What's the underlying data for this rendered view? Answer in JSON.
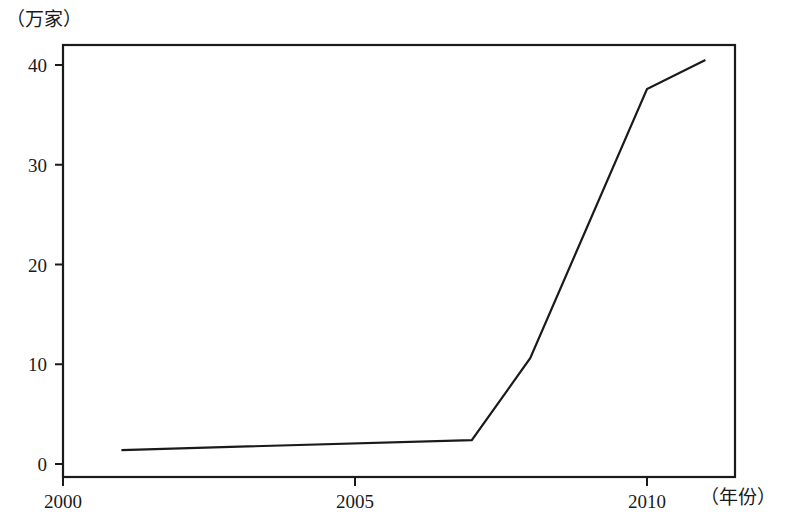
{
  "chart_data": {
    "type": "line",
    "title": "",
    "subtitle": "",
    "xlabel": "（年份）",
    "ylabel": "（万家）",
    "x": [
      2001,
      2007,
      2008,
      2010,
      2011
    ],
    "values": [
      1.4,
      2.4,
      10.6,
      37.6,
      40.5
    ],
    "series": [
      {
        "name": "",
        "x": [
          2001,
          2007,
          2008,
          2010,
          2011
        ],
        "values": [
          1.4,
          2.4,
          10.6,
          37.6,
          40.5
        ]
      }
    ],
    "xlim": [
      2000,
      2011.5
    ],
    "ylim": [
      0,
      42
    ],
    "xticks": [
      2000,
      2005,
      2010
    ],
    "xtick_labels": [
      "2000",
      "2005",
      "2010"
    ],
    "yticks": [
      0,
      10,
      20,
      30,
      40
    ],
    "ytick_labels": [
      "0",
      "10",
      "20",
      "30",
      "40"
    ],
    "grid": false,
    "legend": false,
    "legend_position": "none",
    "line_color": "#1a1a1a",
    "axis_color": "#1a1a1a",
    "background_color": "#ffffff",
    "markers": false,
    "annotations": []
  },
  "axes": {
    "y_unit_label": "（万家）",
    "x_unit_label": "（年份）"
  }
}
